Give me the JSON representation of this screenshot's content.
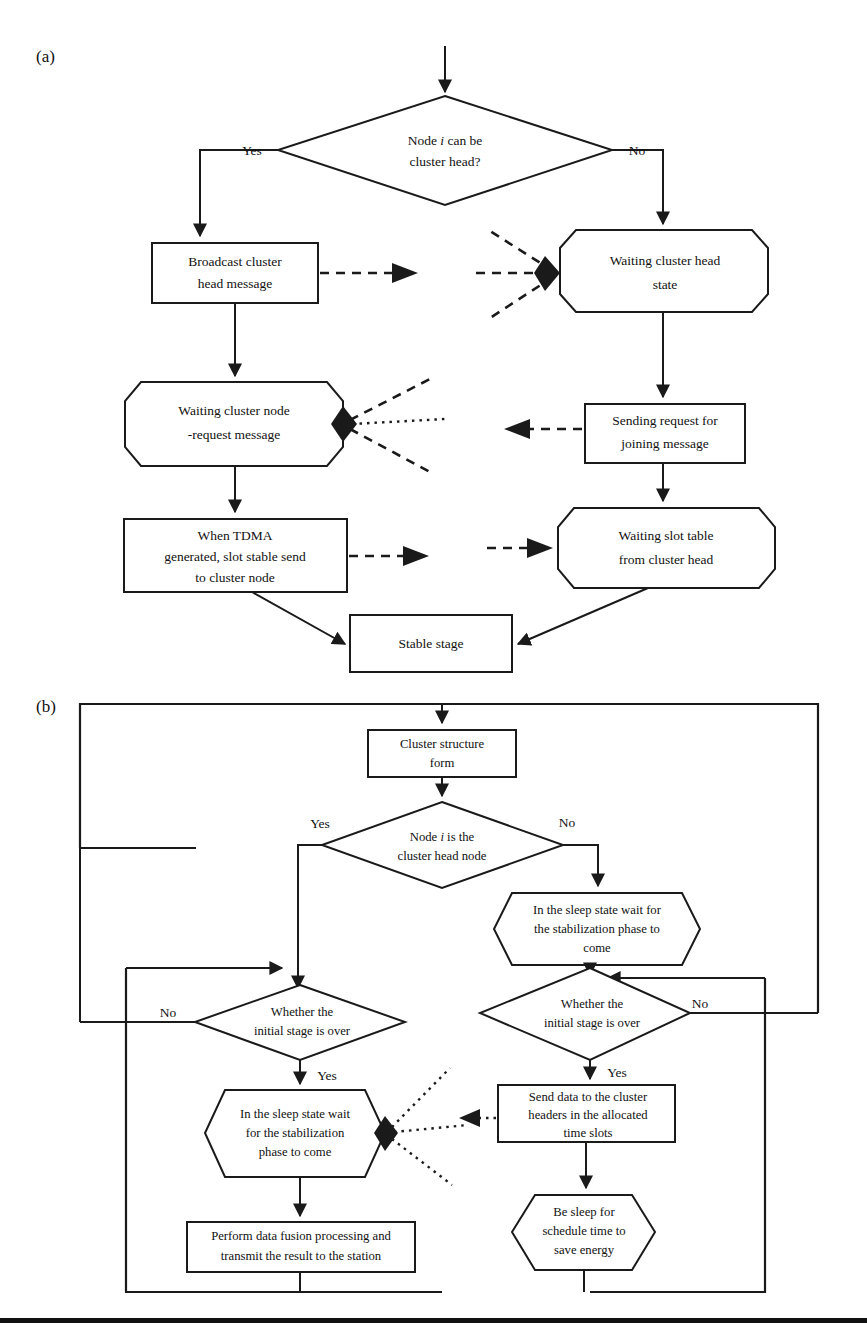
{
  "figure": {
    "panels": [
      {
        "label": "(a)",
        "name": "panel-a-label"
      },
      {
        "label": "(b)",
        "name": "panel-b-label"
      }
    ]
  },
  "panel_a": {
    "nodes": {
      "decision": {
        "line1_pre": "Node ",
        "line1_em": "i",
        "line1_post": " can be",
        "line2": "cluster head?"
      },
      "broadcast": {
        "line1": "Broadcast cluster",
        "line2": "head message"
      },
      "waiting_head_state": {
        "line1": "Waiting cluster head",
        "line2": "state"
      },
      "waiting_node_request": {
        "line1": "Waiting cluster node",
        "line2": "-request message"
      },
      "sending_request": {
        "line1": "Sending request for",
        "line2": "joining message"
      },
      "tdma": {
        "line1": "When TDMA",
        "line2": "generated, slot stable send",
        "line3": "to cluster node"
      },
      "waiting_slot_table": {
        "line1": "Waiting slot table",
        "line2": "from cluster head"
      },
      "stable_stage": {
        "line1": "Stable stage"
      }
    },
    "edge_labels": {
      "yes": "Yes",
      "no": "No"
    }
  },
  "panel_b": {
    "nodes": {
      "cluster_form": {
        "line1": "Cluster structure",
        "line2": "form"
      },
      "decision_head": {
        "line1_pre": "Node ",
        "line1_em": "i",
        "line1_post": " is the",
        "line2": "cluster head node"
      },
      "sleep_right": {
        "line1": "In the sleep state wait for",
        "line2": "the stabilization phase to",
        "line3": "come"
      },
      "decision_left": {
        "line1": "Whether the",
        "line2": "initial stage is over"
      },
      "decision_right": {
        "line1": "Whether the",
        "line2": "initial stage is over"
      },
      "sleep_left": {
        "line1": "In the sleep state wait",
        "line2": "for the stabilization",
        "line3": "phase to come"
      },
      "send_data": {
        "line1": "Send data to the cluster",
        "line2": "headers in the allocated",
        "line3": "time slots"
      },
      "be_sleep": {
        "line1": "Be sleep for",
        "line2": "schedule time to",
        "line3": "save energy"
      },
      "perform_fusion": {
        "line1": "Perform data fusion processing and",
        "line2": "transmit the result to the station"
      }
    },
    "edge_labels": {
      "yes_head": "Yes",
      "no_head": "No",
      "no_left": "No",
      "yes_left": "Yes",
      "no_right": "No",
      "yes_right": "Yes"
    }
  },
  "colors": {
    "ink": "#1a1a1a",
    "paper": "#ffffff"
  }
}
